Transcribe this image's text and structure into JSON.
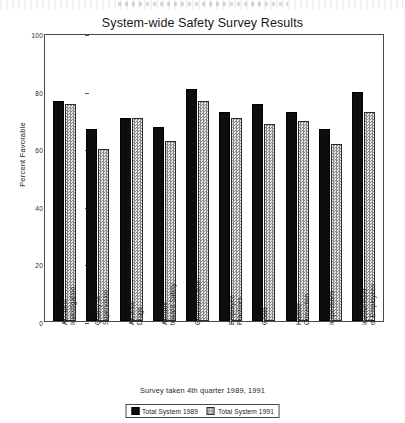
{
  "chart_data": {
    "type": "bar",
    "title": "System-wide Safety Survey Results",
    "xlabel": "Survey taken 4th quarter 1989, 1991",
    "ylabel": "Percent Favorable",
    "ylim": [
      0,
      100
    ],
    "yticks": [
      0,
      20,
      40,
      60,
      80,
      100
    ],
    "grid": false,
    "legend_position": "bottom-center",
    "categories": [
      "Accident\nInvestigation",
      "Quality of\nSupervision",
      "Alcohol/\nDrugs",
      "Attitude\ntoward Safety",
      "Communication",
      "Employee\nPractices",
      "Goals",
      "Hazard\nCorrection",
      "Inspections",
      "Involvement\nof Employees"
    ],
    "series": [
      {
        "name": "Total System 1989",
        "color": "#0d0d0d",
        "values": [
          77,
          67,
          71,
          68,
          81,
          73,
          76,
          73,
          67,
          80
        ]
      },
      {
        "name": "Total System 1991",
        "color": "#cfcfcf",
        "values": [
          76,
          60,
          71,
          63,
          77,
          71,
          69,
          70,
          62,
          73
        ]
      }
    ]
  },
  "legend": {
    "items": [
      {
        "label": "Total System 1989",
        "swatch": "solid-black-swatch"
      },
      {
        "label": "Total System 1991",
        "swatch": "stippled-gray-swatch"
      }
    ]
  }
}
